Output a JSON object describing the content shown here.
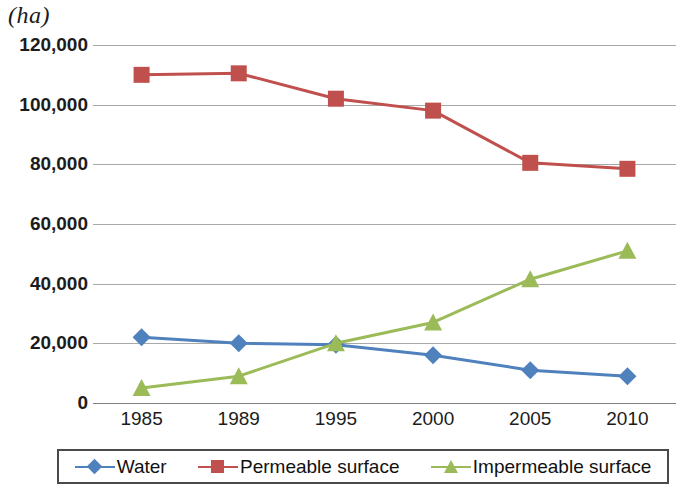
{
  "chart_data": {
    "type": "line",
    "title": "",
    "subtitle": "",
    "xlabel": "",
    "ylabel": "(ha)",
    "categories": [
      "1985",
      "1989",
      "1995",
      "2000",
      "2005",
      "2010"
    ],
    "ylim": [
      0,
      120000
    ],
    "ytick_labels": [
      "120,000",
      "100,000",
      "80,000",
      "60,000",
      "40,000",
      "20,000",
      "0"
    ],
    "ytick_values": [
      120000,
      100000,
      80000,
      60000,
      40000,
      20000,
      0
    ],
    "grid": true,
    "legend_position": "bottom",
    "series": [
      {
        "name": "Water",
        "color": "#4f81bd",
        "marker": "diamond",
        "values": [
          22000,
          20000,
          19500,
          16000,
          11000,
          9000
        ]
      },
      {
        "name": "Permeable surface",
        "color": "#c0504d",
        "marker": "square",
        "values": [
          110000,
          110500,
          102000,
          98000,
          80500,
          78500
        ]
      },
      {
        "name": "Impermeable surface",
        "color": "#9bbb59",
        "marker": "triangle",
        "values": [
          5000,
          9000,
          20000,
          27000,
          41500,
          51000
        ]
      }
    ]
  },
  "legend": {
    "items": [
      {
        "label": "Water"
      },
      {
        "label": "Permeable surface"
      },
      {
        "label": "Impermeable surface"
      }
    ]
  },
  "colors": {
    "water": "#4f81bd",
    "permeable": "#c0504d",
    "impermeable": "#9bbb59",
    "gridline": "#a9a9a9",
    "text": "#1c1c1c",
    "background": "#ffffff"
  }
}
